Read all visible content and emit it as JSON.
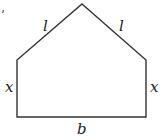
{
  "figure": {
    "shape": "pentagon-house",
    "stroke_color": "#333333",
    "background": "#ffffff",
    "vertices": {
      "apex": [
        82,
        4
      ],
      "top_left": [
        17,
        60
      ],
      "top_right": [
        146,
        60
      ],
      "bottom_right": [
        146,
        117
      ],
      "bottom_left": [
        17,
        117
      ]
    },
    "labels": {
      "left_roof": "l",
      "right_roof": "l",
      "left_side": "x",
      "right_side": "x",
      "base": "b",
      "stray_mark": "’"
    }
  }
}
